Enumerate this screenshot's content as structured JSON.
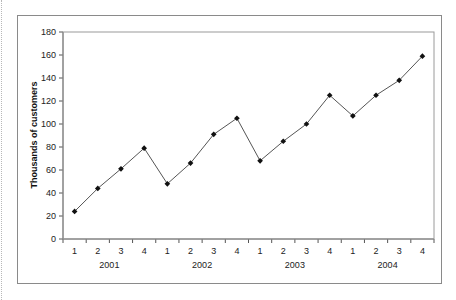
{
  "chart_data": {
    "type": "line",
    "title": "",
    "xlabel": "",
    "ylabel": "Thousands of customers",
    "ylim": [
      0,
      180
    ],
    "yticks": [
      0,
      20,
      40,
      60,
      80,
      100,
      120,
      140,
      160,
      180
    ],
    "grid": false,
    "legend": null,
    "categories": [
      "1",
      "2",
      "3",
      "4",
      "1",
      "2",
      "3",
      "4",
      "1",
      "2",
      "3",
      "4",
      "1",
      "2",
      "3",
      "4"
    ],
    "groups": [
      {
        "label": "2001",
        "quarters": [
          "1",
          "2",
          "3",
          "4"
        ]
      },
      {
        "label": "2002",
        "quarters": [
          "1",
          "2",
          "3",
          "4"
        ]
      },
      {
        "label": "2003",
        "quarters": [
          "1",
          "2",
          "3",
          "4"
        ]
      },
      {
        "label": "2004",
        "quarters": [
          "1",
          "2",
          "3",
          "4"
        ]
      }
    ],
    "series": [
      {
        "name": "Customers",
        "values": [
          24,
          44,
          61,
          79,
          48,
          66,
          91,
          105,
          68,
          85,
          100,
          125,
          107,
          125,
          138,
          159
        ]
      }
    ]
  },
  "colors": {
    "line": "#555555",
    "marker": "#111111",
    "axis": "#555555",
    "frame": "#8a8a8a"
  }
}
